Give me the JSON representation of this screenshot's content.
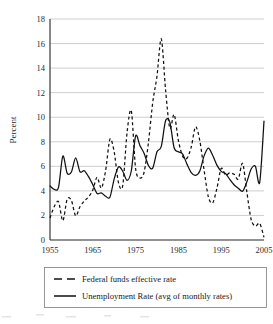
{
  "chart_data": {
    "type": "line",
    "title": "",
    "xlabel": "",
    "ylabel": "Percent",
    "xlim": [
      1955,
      2005
    ],
    "ylim": [
      0,
      18
    ],
    "grid": true,
    "legend_position": "bottom",
    "y_ticks": [
      0,
      2,
      4,
      6,
      8,
      10,
      12,
      14,
      16,
      18
    ],
    "y_tick_labels": [
      "0",
      "2",
      "4",
      "6",
      "8",
      "10",
      "12",
      "14",
      "16",
      "18"
    ],
    "x_ticks": [
      1955,
      1965,
      1975,
      1985,
      1995,
      2005
    ],
    "x_tick_labels": [
      "1955",
      "1965",
      "1975",
      "1985",
      "1995",
      "2005"
    ],
    "series": [
      {
        "name": "Federal funds effective rate",
        "style": "dashed",
        "color": "#111111",
        "x": [
          1955,
          1956,
          1957,
          1958,
          1959,
          1960,
          1961,
          1962,
          1963,
          1964,
          1965,
          1966,
          1967,
          1968,
          1969,
          1970,
          1971,
          1972,
          1973,
          1974,
          1975,
          1976,
          1977,
          1978,
          1979,
          1980,
          1981,
          1982,
          1983,
          1984,
          1985,
          1986,
          1987,
          1988,
          1989,
          1990,
          1991,
          1992,
          1993,
          1994,
          1995,
          1996,
          1997,
          1998,
          1999,
          2000,
          2001,
          2002,
          2003,
          2004,
          2005
        ],
        "values": [
          1.79,
          2.73,
          3.11,
          1.57,
          3.31,
          3.22,
          1.96,
          2.71,
          3.18,
          3.5,
          4.07,
          5.11,
          4.22,
          5.66,
          8.21,
          7.17,
          4.67,
          4.44,
          8.74,
          10.51,
          5.82,
          5.05,
          5.54,
          7.94,
          11.2,
          13.35,
          16.39,
          12.24,
          9.09,
          10.23,
          8.1,
          6.81,
          6.66,
          7.57,
          9.22,
          8.1,
          5.69,
          3.52,
          3.02,
          4.21,
          5.83,
          5.3,
          5.46,
          5.35,
          4.97,
          6.24,
          3.89,
          1.67,
          1.13,
          1.35,
          0.22
        ]
      },
      {
        "name": "Unemployment Rate (avg of monthly rates)",
        "style": "solid",
        "color": "#111111",
        "x": [
          1955,
          1956,
          1957,
          1958,
          1959,
          1960,
          1961,
          1962,
          1963,
          1964,
          1965,
          1966,
          1967,
          1968,
          1969,
          1970,
          1971,
          1972,
          1973,
          1974,
          1975,
          1976,
          1977,
          1978,
          1979,
          1980,
          1981,
          1982,
          1983,
          1984,
          1985,
          1986,
          1987,
          1988,
          1989,
          1990,
          1991,
          1992,
          1993,
          1994,
          1995,
          1996,
          1997,
          1998,
          1999,
          2000,
          2001,
          2002,
          2003,
          2004,
          2005
        ],
        "values": [
          4.4,
          4.13,
          4.3,
          6.84,
          5.45,
          5.54,
          6.69,
          5.57,
          5.64,
          5.16,
          4.51,
          3.79,
          3.84,
          3.56,
          3.49,
          4.98,
          5.95,
          5.6,
          4.86,
          5.64,
          8.48,
          7.7,
          7.05,
          6.07,
          5.85,
          7.18,
          7.62,
          9.71,
          9.6,
          7.51,
          7.19,
          7.0,
          6.18,
          5.49,
          5.26,
          5.62,
          6.85,
          7.49,
          6.91,
          6.1,
          5.59,
          5.41,
          4.94,
          4.5,
          4.22,
          3.97,
          4.74,
          5.78,
          5.99,
          4.7,
          9.68
        ]
      }
    ]
  },
  "axis": {
    "ylabel": "Percent"
  },
  "legend": {
    "entries": [
      {
        "label": "Federal funds effective rate",
        "style": "dashed"
      },
      {
        "label": "Unemployment Rate (avg of monthly rates)",
        "style": "solid"
      }
    ]
  }
}
